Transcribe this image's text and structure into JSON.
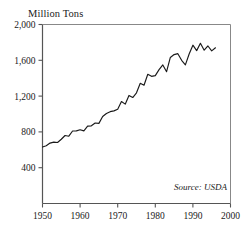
{
  "chart_data": {
    "type": "line",
    "title": "",
    "subtitle": "",
    "ylabel": "Million Tons",
    "xlabel": "",
    "xlim": [
      1950,
      2000
    ],
    "ylim": [
      0,
      2000
    ],
    "grid": false,
    "legend": null,
    "annotations": [
      {
        "name": "source",
        "text": "Source: USDA"
      }
    ],
    "xticks": [
      1950,
      1960,
      1970,
      1980,
      1990,
      2000
    ],
    "xtick_labels": [
      "1950",
      "1960",
      "1970",
      "1980",
      "1990",
      "2000"
    ],
    "yticks": [
      400,
      800,
      1200,
      1600,
      2000
    ],
    "ytick_labels": [
      "400",
      "800",
      "1,200",
      "1,600",
      "2,000"
    ],
    "series": [
      {
        "name": "World Grain Production",
        "color": "#1a1a1a",
        "x": [
          1950,
          1951,
          1952,
          1953,
          1954,
          1955,
          1956,
          1957,
          1958,
          1959,
          1960,
          1961,
          1962,
          1963,
          1964,
          1965,
          1966,
          1967,
          1968,
          1969,
          1970,
          1971,
          1972,
          1973,
          1974,
          1975,
          1976,
          1977,
          1978,
          1979,
          1980,
          1981,
          1982,
          1983,
          1984,
          1985,
          1986,
          1987,
          1988,
          1989,
          1990,
          1991,
          1992,
          1993,
          1994,
          1995,
          1996
        ],
        "values": [
          631,
          645,
          675,
          686,
          682,
          718,
          760,
          752,
          810,
          811,
          824,
          812,
          864,
          868,
          899,
          895,
          972,
          1006,
          1026,
          1035,
          1053,
          1139,
          1110,
          1207,
          1184,
          1237,
          1343,
          1321,
          1444,
          1421,
          1429,
          1496,
          1548,
          1473,
          1632,
          1664,
          1674,
          1600,
          1549,
          1671,
          1769,
          1708,
          1790,
          1713,
          1760,
          1705,
          1740
        ]
      }
    ]
  }
}
